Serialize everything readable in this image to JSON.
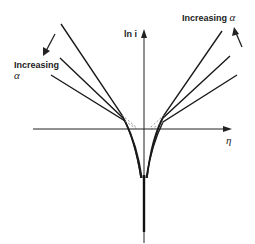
{
  "diagram": {
    "y_axis_label": "ln i",
    "x_axis_label": "η",
    "left_annotation": {
      "line1": "Increasing",
      "line2": "α"
    },
    "right_annotation": {
      "text": "Increasing",
      "symbol": "α"
    },
    "curve_count": 3,
    "colors": {
      "line": "#1a1a1a",
      "background": "#ffffff"
    }
  }
}
